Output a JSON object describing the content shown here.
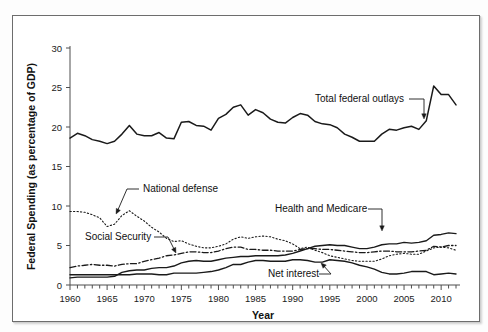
{
  "figure": {
    "frame_color": "#6d6d6d",
    "background": "#ffffff",
    "line_color": "#1a1a1a"
  },
  "chart_data": {
    "type": "line",
    "title": "",
    "xlabel": "Year",
    "ylabel": "Federal Spending (as percentage of GDP)",
    "xlim": [
      1960,
      2012
    ],
    "ylim": [
      0,
      30
    ],
    "xticks": [
      1960,
      1965,
      1970,
      1975,
      1980,
      1985,
      1990,
      1995,
      2000,
      2005,
      2010
    ],
    "xtick_labels": [
      "1960",
      "1965",
      "1970",
      "1975",
      "1980",
      "1985",
      "1990",
      "1995",
      "2000",
      "2005",
      "2010"
    ],
    "minor_xtick_step": 1,
    "yticks": [
      0,
      5,
      10,
      15,
      20,
      25,
      30
    ],
    "ytick_labels": [
      "0",
      "5",
      "10",
      "15",
      "20",
      "25",
      "30"
    ],
    "grid": false,
    "legend": "annotations",
    "x": [
      1960,
      1961,
      1962,
      1963,
      1964,
      1965,
      1966,
      1967,
      1968,
      1969,
      1970,
      1971,
      1972,
      1973,
      1974,
      1975,
      1976,
      1977,
      1978,
      1979,
      1980,
      1981,
      1982,
      1983,
      1984,
      1985,
      1986,
      1987,
      1988,
      1989,
      1990,
      1991,
      1992,
      1993,
      1994,
      1995,
      1996,
      1997,
      1998,
      1999,
      2000,
      2001,
      2002,
      2003,
      2004,
      2005,
      2006,
      2007,
      2008,
      2009,
      2010,
      2011,
      2012
    ],
    "series": [
      {
        "name": "Total federal outlays",
        "style": "solid",
        "width": 1.5,
        "values": [
          18.6,
          19.2,
          18.9,
          18.4,
          18.2,
          17.9,
          18.2,
          19.1,
          20.2,
          19.1,
          18.9,
          18.9,
          19.3,
          18.6,
          18.5,
          20.6,
          20.7,
          20.2,
          20.1,
          19.6,
          21.1,
          21.6,
          22.5,
          22.8,
          21.5,
          22.2,
          21.8,
          21.0,
          20.6,
          20.5,
          21.2,
          21.7,
          21.5,
          20.7,
          20.4,
          20.3,
          19.9,
          19.1,
          18.7,
          18.2,
          18.2,
          18.2,
          19.1,
          19.7,
          19.6,
          19.9,
          20.1,
          19.7,
          20.8,
          25.2,
          24.1,
          24.1,
          22.8
        ]
      },
      {
        "name": "National defense",
        "style": "dotted",
        "width": 1.1,
        "values": [
          9.3,
          9.3,
          9.2,
          8.9,
          8.5,
          7.4,
          7.7,
          8.8,
          9.4,
          8.7,
          8.1,
          7.3,
          6.7,
          5.9,
          5.5,
          5.6,
          5.2,
          4.9,
          4.7,
          4.7,
          4.9,
          5.2,
          5.8,
          6.1,
          5.9,
          6.1,
          6.2,
          6.1,
          5.8,
          5.6,
          5.2,
          4.6,
          4.8,
          4.4,
          4.1,
          3.7,
          3.5,
          3.3,
          3.1,
          3.0,
          3.0,
          3.0,
          3.3,
          3.7,
          3.9,
          4.0,
          3.9,
          3.9,
          4.3,
          4.7,
          4.8,
          4.7,
          4.4
        ]
      },
      {
        "name": "Social Security",
        "style": "dashdot",
        "width": 1.3,
        "values": [
          2.2,
          2.4,
          2.5,
          2.6,
          2.5,
          2.5,
          2.4,
          2.6,
          2.7,
          2.7,
          3.0,
          3.2,
          3.4,
          3.7,
          3.8,
          4.0,
          4.2,
          4.2,
          4.1,
          4.1,
          4.3,
          4.6,
          4.8,
          4.8,
          4.5,
          4.5,
          4.4,
          4.4,
          4.3,
          4.3,
          4.3,
          4.5,
          4.6,
          4.6,
          4.5,
          4.5,
          4.4,
          4.3,
          4.2,
          4.1,
          4.1,
          4.2,
          4.3,
          4.3,
          4.2,
          4.2,
          4.2,
          4.3,
          4.4,
          4.9,
          4.8,
          5.0,
          5.0
        ]
      },
      {
        "name": "Health and Medicare",
        "style": "solid",
        "width": 1.4,
        "values": [
          0.9,
          1.0,
          1.0,
          1.0,
          1.0,
          1.0,
          1.1,
          1.6,
          1.8,
          1.9,
          1.9,
          2.1,
          2.2,
          2.2,
          2.4,
          2.8,
          3.0,
          3.1,
          3.0,
          3.0,
          3.2,
          3.4,
          3.5,
          3.6,
          3.6,
          3.7,
          3.7,
          3.7,
          3.7,
          3.8,
          4.0,
          4.3,
          4.6,
          4.9,
          5.0,
          5.1,
          5.0,
          5.0,
          4.8,
          4.6,
          4.6,
          4.8,
          5.1,
          5.2,
          5.2,
          5.4,
          5.3,
          5.4,
          5.6,
          6.3,
          6.4,
          6.6,
          6.5
        ]
      },
      {
        "name": "Net interest",
        "style": "solid",
        "width": 1.4,
        "values": [
          1.3,
          1.3,
          1.3,
          1.3,
          1.3,
          1.3,
          1.3,
          1.3,
          1.3,
          1.4,
          1.4,
          1.4,
          1.3,
          1.3,
          1.5,
          1.5,
          1.5,
          1.5,
          1.6,
          1.7,
          1.9,
          2.2,
          2.6,
          2.6,
          2.9,
          3.1,
          3.1,
          3.0,
          3.0,
          3.0,
          3.2,
          3.2,
          3.1,
          2.9,
          2.9,
          3.2,
          3.1,
          3.0,
          2.8,
          2.5,
          2.3,
          2.0,
          1.6,
          1.4,
          1.4,
          1.5,
          1.7,
          1.7,
          1.7,
          1.3,
          1.4,
          1.5,
          1.4
        ]
      }
    ],
    "annotations": [
      {
        "id": "total-federal-outlays",
        "text": "Total federal outlays",
        "text_x": 302,
        "text_y": 86,
        "leader": "M 396 83 L 411 83 L 411 101",
        "arrow_x": 411,
        "arrow_y": 103
      },
      {
        "id": "national-defense",
        "text": "National defense",
        "text_x": 130,
        "text_y": 176,
        "leader": "M 126 173 L 114 173 L 104 196",
        "arrow_x": 103,
        "arrow_y": 198
      },
      {
        "id": "social-security",
        "text": "Social Security",
        "text_x": 72,
        "text_y": 224,
        "leader": "M 141 221 L 155 221 L 162 235",
        "arrow_x": 163,
        "arrow_y": 237
      },
      {
        "id": "health-and-medicare",
        "text": "Health and Medicare",
        "text_x": 262,
        "text_y": 196,
        "leader": "M 355 193 L 369 193 L 369 213",
        "arrow_x": 369,
        "arrow_y": 215
      },
      {
        "id": "net-interest",
        "text": "Net interest",
        "text_x": 255,
        "text_y": 261,
        "leader": "M 306 258 L 318 258 L 310 249",
        "arrow_x": 308,
        "arrow_y": 247
      }
    ]
  }
}
